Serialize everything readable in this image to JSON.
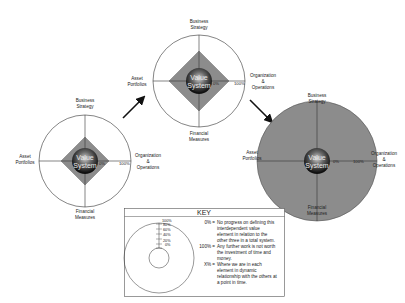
{
  "diagram": {
    "axis_labels": {
      "top_line1": "Business",
      "top_line2": "Strategy",
      "left_line1": "Asset",
      "left_line2": "Portfolios",
      "right_line1": "Organization",
      "right_line2": "&",
      "right_line3": "Operations",
      "bottom_line1": "Financial",
      "bottom_line2": "Measures"
    },
    "center": {
      "line1": "Value",
      "line2": "System"
    },
    "scale": {
      "min": "0%",
      "max": "100%"
    },
    "stages": [
      {
        "name": "early",
        "diamond_pct": 50
      },
      {
        "name": "middle",
        "diamond_pct": 65
      },
      {
        "name": "complete",
        "diamond_pct": 100
      }
    ],
    "colors": {
      "fill": "#8c8c8c",
      "line": "#333333",
      "sphere_dark": "#1a1a1a",
      "sphere_light": "#bdbdbd"
    }
  },
  "key": {
    "title": "KEY",
    "ticks": [
      "100%",
      "80%",
      "60%",
      "40%",
      "20%",
      "0%"
    ],
    "entries": [
      {
        "term": "0% =",
        "lines": [
          "No progress on defining this",
          "interdependent value",
          "element in relation to the",
          "other three in a total system."
        ]
      },
      {
        "term": "100% =",
        "lines": [
          "Any further work is not worth",
          "the investment of time and",
          "money."
        ]
      },
      {
        "term": "X% =",
        "lines": [
          "Where we are in each",
          "element in dynamic",
          "relationship with the others at",
          "a point in time."
        ]
      }
    ]
  }
}
